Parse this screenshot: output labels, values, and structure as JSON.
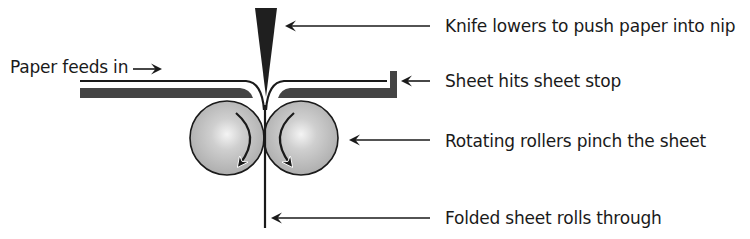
{
  "diagram": {
    "input_label": "Paper feeds in",
    "callouts": [
      {
        "id": "knife",
        "text": "Knife lowers to push paper into nip"
      },
      {
        "id": "stop",
        "text": "Sheet hits sheet stop"
      },
      {
        "id": "rollers",
        "text": "Rotating rollers pinch the sheet"
      },
      {
        "id": "folded",
        "text": "Folded sheet rolls through"
      }
    ],
    "colors": {
      "ink": "#1a1a1a",
      "plate": "#444444",
      "roller_fill": "#bdbdbd",
      "roller_highlight": "#f2f2f2",
      "background": "#ffffff"
    }
  }
}
